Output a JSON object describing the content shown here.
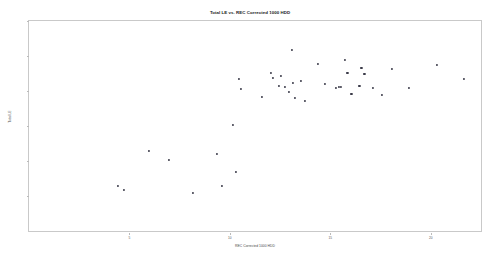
{
  "chart_data": {
    "type": "scatter",
    "title": "Total LE vs. REC Corrected 1000 HDD",
    "xlabel": "REC Corrected 1000 HDD",
    "ylabel": "Total LE",
    "xlim": [
      0,
      22.5
    ],
    "ylim": [
      72,
      84
    ],
    "grid": false,
    "legend": "none",
    "xticks": [
      5,
      10,
      15,
      20
    ],
    "xtick_labels": [
      "5",
      "10",
      "15",
      "20"
    ],
    "yticks": [
      74,
      76,
      78,
      80,
      82,
      84
    ],
    "ytick_labels": [
      "74",
      "76",
      "78",
      "80",
      "82",
      "84"
    ],
    "marker": "dot",
    "marker_color": "#3a3a48",
    "points": [
      {
        "x": 4.45,
        "y": 74.55
      },
      {
        "x": 4.72,
        "y": 74.35
      },
      {
        "x": 5.95,
        "y": 76.55
      },
      {
        "x": 6.95,
        "y": 76.05
      },
      {
        "x": 8.15,
        "y": 74.2
      },
      {
        "x": 9.35,
        "y": 76.4
      },
      {
        "x": 9.62,
        "y": 74.6
      },
      {
        "x": 10.15,
        "y": 78.05
      },
      {
        "x": 10.3,
        "y": 75.35
      },
      {
        "x": 10.45,
        "y": 80.7
      },
      {
        "x": 10.55,
        "y": 80.1
      },
      {
        "x": 11.6,
        "y": 79.65
      },
      {
        "x": 12.05,
        "y": 81.05
      },
      {
        "x": 12.15,
        "y": 80.75
      },
      {
        "x": 12.45,
        "y": 80.3
      },
      {
        "x": 12.55,
        "y": 80.85
      },
      {
        "x": 12.75,
        "y": 80.25
      },
      {
        "x": 12.95,
        "y": 79.95
      },
      {
        "x": 13.1,
        "y": 82.35
      },
      {
        "x": 13.15,
        "y": 80.45
      },
      {
        "x": 13.25,
        "y": 79.6
      },
      {
        "x": 13.55,
        "y": 80.55
      },
      {
        "x": 13.75,
        "y": 79.45
      },
      {
        "x": 14.4,
        "y": 81.55
      },
      {
        "x": 14.75,
        "y": 80.4
      },
      {
        "x": 15.3,
        "y": 80.2
      },
      {
        "x": 15.45,
        "y": 80.25
      },
      {
        "x": 15.55,
        "y": 80.25
      },
      {
        "x": 15.75,
        "y": 81.75
      },
      {
        "x": 15.85,
        "y": 81.05
      },
      {
        "x": 16.05,
        "y": 79.85
      },
      {
        "x": 16.45,
        "y": 80.3
      },
      {
        "x": 16.55,
        "y": 81.3
      },
      {
        "x": 16.7,
        "y": 80.95
      },
      {
        "x": 17.1,
        "y": 80.15
      },
      {
        "x": 17.55,
        "y": 79.75
      },
      {
        "x": 18.05,
        "y": 81.25
      },
      {
        "x": 18.9,
        "y": 80.15
      },
      {
        "x": 20.3,
        "y": 81.5
      },
      {
        "x": 21.65,
        "y": 80.7
      }
    ]
  }
}
